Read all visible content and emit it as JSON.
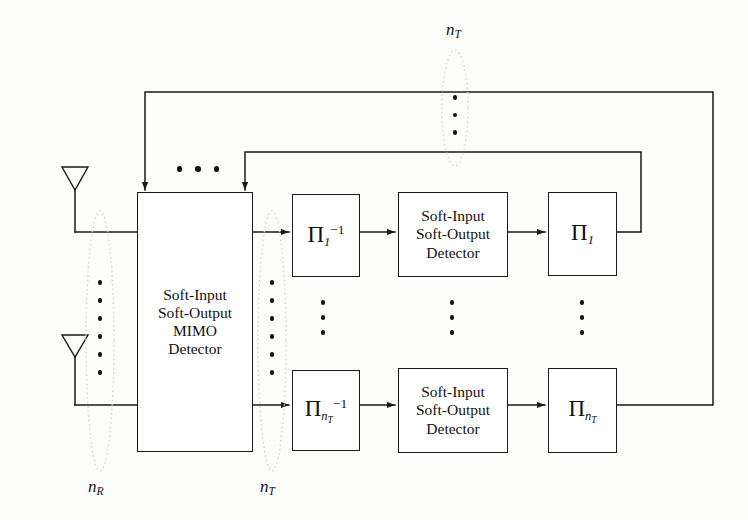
{
  "figure": {
    "stroke_color": "#1a1a1a",
    "ellipse_color": "#cfcfcf",
    "background": "#fdfdfc"
  },
  "blocks": {
    "mimo_detector": {
      "line1": "Soft-Input",
      "line2": "Soft-Output",
      "line3": "MIMO",
      "line4": "Detector"
    },
    "deinterleaver_first": {
      "pi": "Π",
      "sub": "1",
      "sup": "−1"
    },
    "deinterleaver_last": {
      "pi": "Π",
      "sub": "n",
      "sub2": "T",
      "sup": "−1"
    },
    "siso_detector_first": {
      "line1": "Soft-Input",
      "line2": "Soft-Output",
      "line3": "Detector"
    },
    "siso_detector_last": {
      "line1": "Soft-Input",
      "line2": "Soft-Output",
      "line3": "Detector"
    },
    "interleaver_first": {
      "pi": "Π",
      "sub": "1"
    },
    "interleaver_last": {
      "pi": "Π",
      "sub": "n",
      "sub2": "T"
    }
  },
  "labels": {
    "n_r": {
      "base": "n",
      "sub": "R"
    },
    "n_t_output": {
      "base": "n",
      "sub": "T"
    },
    "n_t_feedback": {
      "base": "n",
      "sub": "T"
    }
  },
  "antennas": {
    "top": "receive-antenna",
    "bottom": "receive-antenna"
  },
  "ellipsis": {
    "receive_chain_dots": 6,
    "transmit_chain_dots": 6,
    "feedback_dots": 3,
    "top_row_dots": 3,
    "column_dots": 3
  }
}
